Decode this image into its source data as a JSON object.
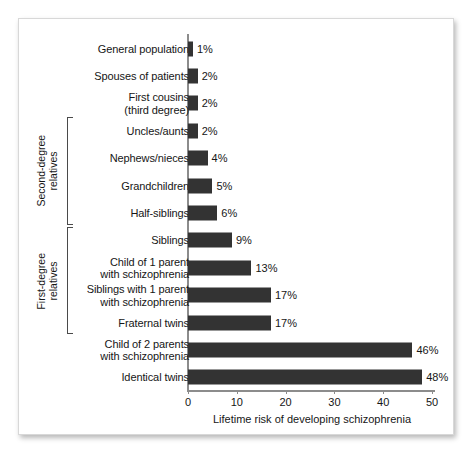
{
  "chart_data": {
    "type": "bar",
    "orientation": "horizontal",
    "title": "",
    "xlabel": "Lifetime risk of developing schizophrenia",
    "ylabel": "",
    "xlim": [
      0,
      50
    ],
    "xticks": [
      0,
      10,
      20,
      30,
      40,
      50
    ],
    "xtick_labels": [
      "0",
      "10",
      "20",
      "30",
      "40",
      "50"
    ],
    "grid": false,
    "legend": null,
    "bar_color": "#333333",
    "axis_color": "#8c8c8c",
    "categories": [
      "General population",
      "Spouses of patients",
      "First cousins\n(third degree)",
      "Uncles/aunts",
      "Nephews/nieces",
      "Grandchildren",
      "Half-siblings",
      "Siblings",
      "Child of 1 parent\nwith schizophrenia",
      "Siblings with 1 parent\nwith schizophrenia",
      "Fraternal twins",
      "Child of 2 parents\nwith schizophrenia",
      "Identical twins"
    ],
    "values": [
      1,
      2,
      2,
      2,
      4,
      5,
      6,
      9,
      13,
      17,
      17,
      46,
      48
    ],
    "value_labels": [
      "1%",
      "2%",
      "2%",
      "2%",
      "4%",
      "5%",
      "6%",
      "9%",
      "13%",
      "17%",
      "17%",
      "46%",
      "48%"
    ],
    "groups": [
      {
        "label": "Second-degree\nrelatives",
        "first_index": 3,
        "last_index": 6
      },
      {
        "label": "First-degree\nrelatives",
        "first_index": 7,
        "last_index": 10
      }
    ]
  }
}
